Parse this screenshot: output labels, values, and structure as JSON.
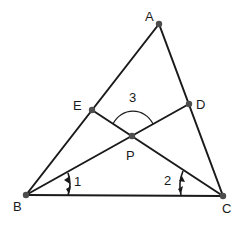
{
  "diagram": {
    "type": "geometry",
    "points": {
      "A": {
        "label": "A",
        "x": 159,
        "y": 24,
        "lx": 145,
        "ly": 21
      },
      "B": {
        "label": "B",
        "x": 26,
        "y": 195,
        "lx": 13,
        "ly": 211
      },
      "C": {
        "label": "C",
        "x": 223,
        "y": 196,
        "lx": 222,
        "ly": 213
      },
      "D": {
        "label": "D",
        "x": 189,
        "y": 104,
        "lx": 196,
        "ly": 109
      },
      "E": {
        "label": "E",
        "x": 92,
        "y": 110,
        "lx": 73,
        "ly": 110
      },
      "P": {
        "label": "P",
        "x": 132,
        "y": 136,
        "lx": 126,
        "ly": 160
      }
    },
    "segments": [
      [
        "A",
        "B"
      ],
      [
        "A",
        "C"
      ],
      [
        "B",
        "C"
      ],
      [
        "B",
        "D"
      ],
      [
        "C",
        "E"
      ]
    ],
    "angles": [
      {
        "label": "1",
        "at": "B",
        "lx": 74,
        "ly": 186
      },
      {
        "label": "2",
        "at": "C",
        "lx": 164,
        "ly": 185
      },
      {
        "label": "3",
        "at": "P",
        "lx": 129,
        "ly": 102
      }
    ]
  }
}
